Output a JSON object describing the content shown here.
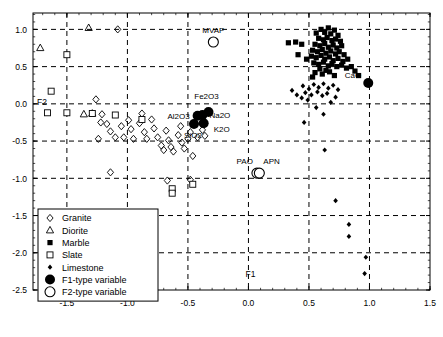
{
  "chart_data": {
    "type": "scatter",
    "title": "",
    "xlabel": "F1",
    "ylabel": "F2",
    "xlim": [
      -1.78,
      1.5
    ],
    "ylim": [
      -2.5,
      1.22
    ],
    "xticks": [
      -1.5,
      -1.0,
      -0.5,
      0.0,
      0.5,
      1.0,
      1.5
    ],
    "xticklabels": [
      "-1.5",
      "-1.0",
      "-0.5",
      "0.0",
      "0.5",
      "1.0",
      "1.5"
    ],
    "yticks": [
      1.0,
      0.5,
      0.0,
      -0.5,
      -1.0,
      -1.5,
      -2.0,
      -2.5
    ],
    "yticklabels": [
      "1.0",
      "0.5",
      "0.0",
      "-0.5",
      "-1.0",
      "-1.5",
      "-2.0",
      "-2.5"
    ],
    "grid": "dashed-both",
    "legend_position": "lower-left",
    "series": [
      {
        "name": "Granite",
        "marker": "open-diamond",
        "points": [
          [
            -1.08,
            1.0
          ],
          [
            -1.26,
            0.06
          ],
          [
            -1.21,
            -0.14
          ],
          [
            -1.22,
            -0.25
          ],
          [
            -1.24,
            -0.47
          ],
          [
            -1.17,
            -0.27
          ],
          [
            -1.14,
            -0.37
          ],
          [
            -1.1,
            -0.45
          ],
          [
            -1.05,
            -0.3
          ],
          [
            -1.03,
            -0.45
          ],
          [
            -0.99,
            -0.22
          ],
          [
            -0.97,
            -0.34
          ],
          [
            -0.95,
            -0.47
          ],
          [
            -0.9,
            -0.26
          ],
          [
            -0.88,
            -0.13
          ],
          [
            -0.86,
            -0.38
          ],
          [
            -0.84,
            -0.47
          ],
          [
            -0.8,
            -0.21
          ],
          [
            -0.78,
            -0.33
          ],
          [
            -0.75,
            -0.45
          ],
          [
            -0.72,
            -0.56
          ],
          [
            -0.7,
            -0.62
          ],
          [
            -0.68,
            -0.36
          ],
          [
            -0.66,
            -0.49
          ],
          [
            -0.64,
            -0.58
          ],
          [
            -0.62,
            -0.64
          ],
          [
            -0.58,
            -0.42
          ],
          [
            -0.56,
            -0.3
          ],
          [
            -0.55,
            -0.52
          ],
          [
            -0.53,
            -0.6
          ],
          [
            -0.5,
            -0.47
          ],
          [
            -0.48,
            -0.38
          ],
          [
            -0.46,
            -0.7
          ],
          [
            -0.44,
            -0.27
          ],
          [
            -0.42,
            -0.45
          ],
          [
            -0.38,
            -0.35
          ],
          [
            -0.36,
            -0.43
          ],
          [
            -0.67,
            -1.03
          ],
          [
            -0.48,
            -1.02
          ],
          [
            -1.14,
            -0.92
          ]
        ]
      },
      {
        "name": "Diorite",
        "marker": "open-triangle",
        "points": [
          [
            -1.72,
            0.75
          ],
          [
            -1.32,
            1.02
          ],
          [
            -1.29,
            -0.13
          ],
          [
            -1.36,
            -0.14
          ]
        ]
      },
      {
        "name": "Marble",
        "marker": "filled-square",
        "points": [
          [
            0.56,
            0.95
          ],
          [
            0.6,
            1.0
          ],
          [
            0.63,
            0.96
          ],
          [
            0.66,
            1.02
          ],
          [
            0.68,
            0.94
          ],
          [
            0.71,
            0.99
          ],
          [
            0.74,
            0.92
          ],
          [
            0.58,
            0.88
          ],
          [
            0.62,
            0.86
          ],
          [
            0.65,
            0.89
          ],
          [
            0.69,
            0.85
          ],
          [
            0.72,
            0.87
          ],
          [
            0.76,
            0.84
          ],
          [
            0.55,
            0.8
          ],
          [
            0.59,
            0.78
          ],
          [
            0.63,
            0.81
          ],
          [
            0.66,
            0.76
          ],
          [
            0.7,
            0.79
          ],
          [
            0.73,
            0.75
          ],
          [
            0.77,
            0.78
          ],
          [
            0.53,
            0.72
          ],
          [
            0.57,
            0.7
          ],
          [
            0.61,
            0.73
          ],
          [
            0.64,
            0.68
          ],
          [
            0.68,
            0.71
          ],
          [
            0.72,
            0.67
          ],
          [
            0.75,
            0.7
          ],
          [
            0.79,
            0.66
          ],
          [
            0.52,
            0.64
          ],
          [
            0.56,
            0.62
          ],
          [
            0.6,
            0.65
          ],
          [
            0.63,
            0.6
          ],
          [
            0.67,
            0.63
          ],
          [
            0.7,
            0.58
          ],
          [
            0.74,
            0.61
          ],
          [
            0.78,
            0.57
          ],
          [
            0.82,
            0.6
          ],
          [
            0.54,
            0.55
          ],
          [
            0.58,
            0.53
          ],
          [
            0.62,
            0.56
          ],
          [
            0.66,
            0.51
          ],
          [
            0.69,
            0.54
          ],
          [
            0.73,
            0.5
          ],
          [
            0.77,
            0.52
          ],
          [
            0.81,
            0.48
          ],
          [
            0.85,
            0.5
          ],
          [
            0.88,
            0.44
          ],
          [
            0.59,
            0.47
          ],
          [
            0.64,
            0.45
          ],
          [
            0.55,
            0.42
          ],
          [
            0.61,
            0.4
          ],
          [
            0.67,
            0.43
          ],
          [
            0.71,
            0.38
          ],
          [
            0.91,
            0.38
          ],
          [
            0.53,
            0.36
          ],
          [
            0.48,
            0.6
          ],
          [
            0.44,
            0.8
          ],
          [
            0.39,
            0.83
          ],
          [
            0.33,
            0.82
          ],
          [
            0.41,
            0.66
          ]
        ]
      },
      {
        "name": "Slate",
        "marker": "open-square",
        "points": [
          [
            -1.5,
            0.66
          ],
          [
            -1.63,
            0.17
          ],
          [
            -1.66,
            -0.12
          ],
          [
            -1.5,
            -0.12
          ],
          [
            -1.29,
            -0.13
          ],
          [
            -1.1,
            -0.15
          ],
          [
            -0.88,
            -0.21
          ],
          [
            -0.63,
            -1.14
          ],
          [
            -0.63,
            -1.2
          ],
          [
            -0.46,
            -1.08
          ]
        ]
      },
      {
        "name": "Limestone",
        "marker": "small-filled-diamond",
        "points": [
          [
            0.45,
            0.24
          ],
          [
            0.5,
            0.2
          ],
          [
            0.54,
            0.26
          ],
          [
            0.58,
            0.22
          ],
          [
            0.62,
            0.27
          ],
          [
            0.66,
            0.21
          ],
          [
            0.7,
            0.25
          ],
          [
            0.74,
            0.19
          ],
          [
            0.47,
            0.15
          ],
          [
            0.52,
            0.12
          ],
          [
            0.57,
            0.16
          ],
          [
            0.61,
            0.11
          ],
          [
            0.65,
            0.14
          ],
          [
            0.44,
            0.08
          ],
          [
            0.49,
            0.05
          ],
          [
            0.72,
            0.09
          ],
          [
            0.56,
            -0.05
          ],
          [
            0.62,
            -0.14
          ],
          [
            0.46,
            -0.25
          ],
          [
            0.63,
            -0.62
          ],
          [
            0.72,
            -1.3
          ],
          [
            0.83,
            -1.62
          ],
          [
            0.83,
            -1.78
          ],
          [
            0.97,
            -2.06
          ],
          [
            0.96,
            -2.28
          ],
          [
            0.36,
            0.18
          ],
          [
            0.4,
            0.12
          ],
          [
            0.68,
            0.02
          ]
        ]
      },
      {
        "name": "F1-type variable",
        "marker": "large-filled-circle",
        "labeled_points": [
          {
            "label": "Fe2O3",
            "x": -0.33,
            "y": -0.11,
            "label_dx": -2,
            "label_dy": -13,
            "label_anchor": "middle"
          },
          {
            "label": "Na2O",
            "x": -0.38,
            "y": -0.15,
            "label_dx": 7,
            "label_dy": 3,
            "label_anchor": "start"
          },
          {
            "label": "Al2O3",
            "x": -0.42,
            "y": -0.16,
            "label_dx": -8,
            "label_dy": 3,
            "label_anchor": "end"
          },
          {
            "label": "K2O",
            "x": -0.37,
            "y": -0.26,
            "label_dx": 10,
            "label_dy": 9,
            "label_anchor": "start"
          },
          {
            "label": "SiO2",
            "x": -0.45,
            "y": -0.27,
            "label_dx": -1,
            "label_dy": 14,
            "label_anchor": "middle"
          },
          {
            "label": "CaO",
            "x": 0.99,
            "y": 0.28,
            "label_dx": -7,
            "label_dy": -5,
            "label_anchor": "end"
          }
        ]
      },
      {
        "name": "F2-type variable",
        "marker": "large-open-circle",
        "labeled_points": [
          {
            "label": "MVAP",
            "x": -0.29,
            "y": 0.83,
            "label_dx": 0,
            "label_dy": -9,
            "label_anchor": "middle"
          },
          {
            "label": "PAO",
            "x": 0.07,
            "y": -0.93,
            "label_dx": -4,
            "label_dy": -9,
            "label_anchor": "end"
          },
          {
            "label": "APN",
            "x": 0.09,
            "y": -0.93,
            "label_dx": 4,
            "label_dy": -9,
            "label_anchor": "start"
          }
        ]
      }
    ]
  },
  "legend": {
    "items": [
      {
        "label": "Granite",
        "marker": "open-diamond"
      },
      {
        "label": "Diorite",
        "marker": "open-triangle"
      },
      {
        "label": "Marble",
        "marker": "filled-square"
      },
      {
        "label": "Slate",
        "marker": "open-square"
      },
      {
        "label": "Limestone",
        "marker": "small-filled-diamond"
      },
      {
        "label": "F1-type variable",
        "marker": "large-filled-circle"
      },
      {
        "label": "F2-type variable",
        "marker": "large-open-circle"
      }
    ]
  },
  "colors": {
    "axis": "#000000",
    "grid": "#000000",
    "marker": "#000000",
    "background": "#ffffff"
  }
}
